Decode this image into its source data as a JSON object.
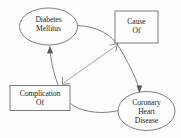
{
  "diagram": {
    "background_color": "#fdfdfd",
    "stroke_color": "#6f6f6f",
    "text_color": "#1b1b1b",
    "nodes": [
      {
        "id": "diabetes-mellitus",
        "shape": "ellipse",
        "line1": "Diabetes",
        "line2": "Mellitus"
      },
      {
        "id": "cause-of",
        "shape": "rectangle",
        "line1": "Cause",
        "line2": "Of"
      },
      {
        "id": "complication-of",
        "shape": "rectangle",
        "line1": "Complication",
        "line2": "Of"
      },
      {
        "id": "coronary-heart-disease",
        "shape": "ellipse",
        "line1": "Coronary",
        "line2": "Heart",
        "line3": "Disease"
      }
    ],
    "edges": [
      {
        "id": "diabetes-to-coronary",
        "from": "diabetes-mellitus",
        "to": "coronary-heart-disease",
        "style": "curved",
        "arrowhead": "solid",
        "direction": "one-way"
      },
      {
        "id": "coronary-to-diabetes",
        "from": "coronary-heart-disease",
        "to": "diabetes-mellitus",
        "style": "curved",
        "arrowhead": "solid",
        "direction": "one-way"
      },
      {
        "id": "cause-complication-link",
        "from": "cause-of",
        "to": "complication-of",
        "style": "straight",
        "arrowhead": "open",
        "direction": "bidirectional"
      }
    ]
  }
}
